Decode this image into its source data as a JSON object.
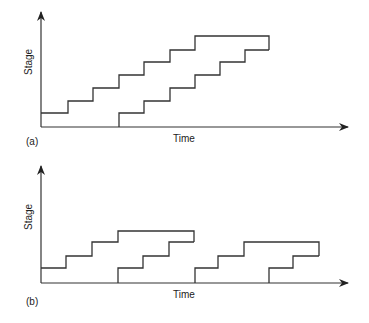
{
  "panels": [
    {
      "id": "a",
      "label": "(a)",
      "y_axis_label": "Stage",
      "x_axis_label": "Time",
      "series": [
        {
          "name": "upper-staircase",
          "points": [
            [
              41,
              113
            ],
            [
              68,
              113
            ],
            [
              68,
              101
            ],
            [
              93,
              101
            ],
            [
              93,
              88
            ],
            [
              119,
              88
            ],
            [
              119,
              75
            ],
            [
              144,
              75
            ],
            [
              144,
              62
            ],
            [
              170,
              62
            ],
            [
              170,
              50
            ],
            [
              195,
              50
            ],
            [
              195,
              36
            ],
            [
              269,
              36
            ],
            [
              269,
              50
            ]
          ]
        },
        {
          "name": "lower-staircase",
          "points": [
            [
              119,
              127
            ],
            [
              119,
              113
            ],
            [
              144,
              113
            ],
            [
              144,
              101
            ],
            [
              170,
              101
            ],
            [
              170,
              88
            ],
            [
              195,
              88
            ],
            [
              195,
              75
            ],
            [
              220,
              75
            ],
            [
              220,
              62
            ],
            [
              245,
              62
            ],
            [
              245,
              50
            ],
            [
              269,
              50
            ]
          ]
        }
      ]
    },
    {
      "id": "b",
      "label": "(b)",
      "y_axis_label": "Stage",
      "x_axis_label": "Time",
      "series": [
        {
          "name": "group1-upper",
          "points": [
            [
              41,
              268
            ],
            [
              66,
              268
            ],
            [
              66,
              256
            ],
            [
              92,
              256
            ],
            [
              92,
              242
            ],
            [
              118,
              242
            ],
            [
              118,
              231
            ],
            [
              194,
              231
            ],
            [
              194,
              242
            ]
          ]
        },
        {
          "name": "group1-lower",
          "points": [
            [
              118,
              283
            ],
            [
              118,
              268
            ],
            [
              143,
              268
            ],
            [
              143,
              256
            ],
            [
              169,
              256
            ],
            [
              169,
              242
            ],
            [
              194,
              242
            ]
          ]
        },
        {
          "name": "group2-upper",
          "points": [
            [
              195,
              283
            ],
            [
              195,
              268
            ],
            [
              218,
              268
            ],
            [
              218,
              256
            ],
            [
              244,
              256
            ],
            [
              244,
              242
            ],
            [
              319,
              242
            ],
            [
              319,
              256
            ]
          ]
        },
        {
          "name": "group2-lower",
          "points": [
            [
              269,
              283
            ],
            [
              269,
              268
            ],
            [
              293,
              268
            ],
            [
              293,
              256
            ],
            [
              319,
              256
            ]
          ]
        }
      ]
    }
  ]
}
